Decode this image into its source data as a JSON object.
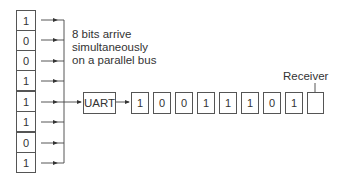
{
  "diagram": {
    "parallel_register": {
      "bits": [
        "1",
        "0",
        "0",
        "1",
        "1",
        "1",
        "0",
        "1"
      ]
    },
    "bus_caption": {
      "line1": "8 bits arrive",
      "line2": "simultaneously",
      "line3": "on a parallel bus"
    },
    "uart_label": "UART",
    "serial_stream": {
      "bits": [
        "1",
        "0",
        "0",
        "1",
        "1",
        "1",
        "0",
        "1"
      ]
    },
    "receiver_label": "Receiver",
    "colors": {
      "stroke": "#555555",
      "text": "#333333",
      "background": "#ffffff"
    }
  }
}
